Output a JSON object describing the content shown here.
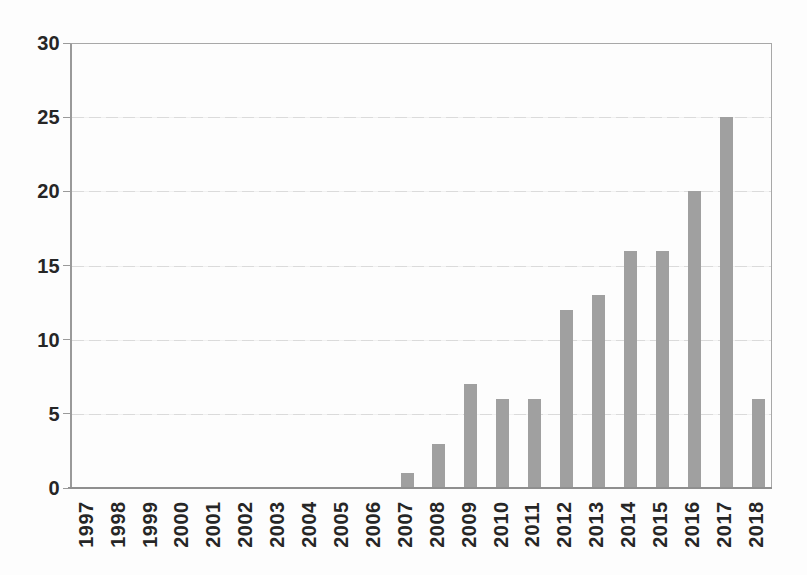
{
  "figure": {
    "title": "",
    "caption": "",
    "background_color": "#fdfdfd"
  },
  "chart_data": {
    "type": "bar",
    "categories": [
      "1997",
      "1998",
      "1999",
      "2000",
      "2001",
      "2002",
      "2003",
      "2004",
      "2005",
      "2006",
      "2007",
      "2008",
      "2009",
      "2010",
      "2011",
      "2012",
      "2013",
      "2014",
      "2015",
      "2016",
      "2017",
      "2018"
    ],
    "values": [
      0,
      0,
      0,
      0,
      0,
      0,
      0,
      0,
      0,
      0,
      1,
      3,
      7,
      6,
      6,
      12,
      13,
      16,
      16,
      20,
      25,
      6
    ],
    "title": "",
    "xlabel": "",
    "ylabel": "",
    "ylim": [
      0,
      30
    ],
    "y_ticks": [
      0,
      5,
      10,
      15,
      20,
      25,
      30
    ],
    "grid": "horizontal",
    "legend": "none",
    "bar_color": "#a0a0a0",
    "gridline_color": "#d9d9d9",
    "axis_color": "#8f8f8f",
    "tick_color": "#9a9a9a",
    "label_color": "#262626"
  }
}
